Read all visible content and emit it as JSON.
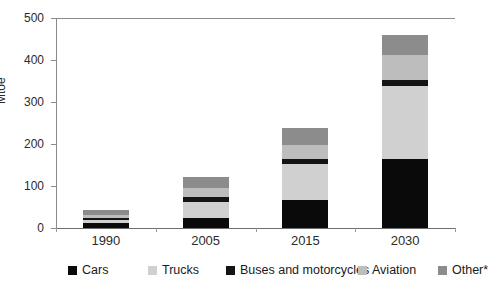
{
  "figure": {
    "cropped_title_remnant": "",
    "y_axis_title": "Mtoe"
  },
  "chart_data": {
    "type": "bar",
    "stacked": true,
    "title": "",
    "xlabel": "",
    "ylabel": "Mtoe",
    "ylim": [
      0,
      500
    ],
    "yticks": [
      0,
      100,
      200,
      300,
      400,
      500
    ],
    "ytick_labels": [
      "0",
      "100",
      "200",
      "300",
      "400",
      "500"
    ],
    "grid": false,
    "legend_position": "bottom",
    "categories": [
      "1990",
      "2005",
      "2015",
      "2030"
    ],
    "series": [
      {
        "name": "Cars",
        "color": "#0a0a0a",
        "values": [
          11,
          24,
          66,
          164
        ]
      },
      {
        "name": "Trucks",
        "color": "#d0d0d0",
        "values": [
          7,
          38,
          87,
          174
        ]
      },
      {
        "name": "Buses and motorcycles",
        "color": "#141414",
        "values": [
          5,
          13,
          12,
          15
        ]
      },
      {
        "name": "Aviation",
        "color": "#bdbdbd",
        "values": [
          8,
          21,
          33,
          58
        ]
      },
      {
        "name": "Other*",
        "color": "#8c8c8c",
        "values": [
          11,
          25,
          41,
          48
        ]
      }
    ],
    "totals": [
      42,
      121,
      239,
      459
    ]
  },
  "legend": {
    "items": [
      {
        "label": "Cars",
        "color": "#0a0a0a"
      },
      {
        "label": "Trucks",
        "color": "#d0d0d0"
      },
      {
        "label": "Buses and motorcycles",
        "color": "#141414"
      },
      {
        "label": "Aviation",
        "color": "#bdbdbd"
      },
      {
        "label": "Other*",
        "color": "#8c8c8c"
      }
    ]
  }
}
